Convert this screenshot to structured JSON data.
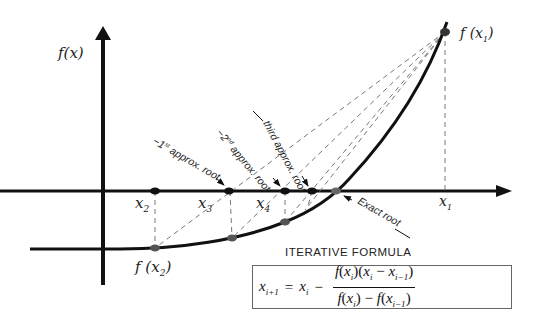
{
  "diagram": {
    "axes": {
      "y_label": "f(x)",
      "x_axis_y": 191,
      "y_axis_x": 103
    },
    "curve_color": "#111111",
    "dashed_color": "#777777",
    "point_color": "#111111",
    "root_point_color": "#666666",
    "x_points": [
      {
        "name": "x2",
        "label": "x",
        "sub": "2",
        "x": 155
      },
      {
        "name": "x3",
        "label": "x",
        "sub": "3",
        "x": 228
      },
      {
        "name": "x4",
        "label": "x",
        "sub": "4",
        "x": 285
      },
      {
        "name": "x5",
        "label": "",
        "sub": "",
        "x": 312
      },
      {
        "name": "x1",
        "label": "x",
        "sub": "1",
        "x": 445
      }
    ],
    "function_points": [
      {
        "name": "f(x2)",
        "label": "f (x",
        "sub": "2",
        "x": 155,
        "y": 248
      },
      {
        "name": "f(x1)",
        "label": "f (x",
        "sub": "1",
        "x": 445,
        "y": 32
      }
    ],
    "annotations": {
      "first_approx": "−1st approx. root",
      "first_approx_main": "−1",
      "first_approx_sup": "st",
      "first_approx_rest": " approx. root",
      "second_approx_main": "−2",
      "second_approx_sup": "nd",
      "second_approx_rest": " approx. root",
      "third_approx": "third approx. root",
      "exact_root": "Exact root"
    },
    "formula": {
      "title": "ITERATIVE FORMULA",
      "lhs_var": "x",
      "lhs_sub": "i+1",
      "equals": "=",
      "rhs_var": "x",
      "rhs_sub": "i",
      "minus": "−",
      "numerator": "f (x_i)(x_i − x_{i−1})",
      "denominator": "f (x_i) − f (x_{i−1})"
    }
  }
}
